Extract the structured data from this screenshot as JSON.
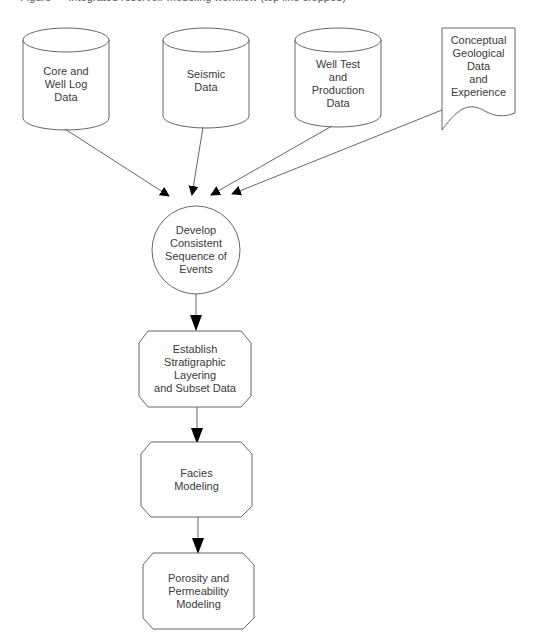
{
  "caption": "Figure — Integrated reservoir modeling workflow (top line cropped)",
  "colors": {
    "stroke": "#555555",
    "fill": "#ffffff",
    "text": "#3a3a3a",
    "arrow": "#000000"
  },
  "nodes": {
    "core": {
      "shape": "cylinder",
      "label": "Core and\nWell Log\nData"
    },
    "seismic": {
      "shape": "cylinder",
      "label": "Seismic\nData"
    },
    "welltest": {
      "shape": "cylinder",
      "label": "Well Test\nand\nProduction\nData"
    },
    "conceptual": {
      "shape": "document",
      "label": "Conceptual\nGeological\nData\nand\nExperience"
    },
    "sequence": {
      "shape": "circle",
      "label": "Develop\nConsistent\nSequence of\nEvents"
    },
    "stratigraphic": {
      "shape": "octagon",
      "label": "Establish\nStratigraphic\nLayering\nand Subset Data"
    },
    "facies": {
      "shape": "octagon",
      "label": "Facies\nModeling"
    },
    "porosity": {
      "shape": "octagon",
      "label": "Porosity and\nPermeability\nModeling"
    }
  },
  "edges": [
    {
      "from": "core",
      "to": "sequence"
    },
    {
      "from": "seismic",
      "to": "sequence"
    },
    {
      "from": "welltest",
      "to": "sequence"
    },
    {
      "from": "conceptual",
      "to": "sequence"
    },
    {
      "from": "sequence",
      "to": "stratigraphic"
    },
    {
      "from": "stratigraphic",
      "to": "facies"
    },
    {
      "from": "facies",
      "to": "porosity"
    }
  ]
}
